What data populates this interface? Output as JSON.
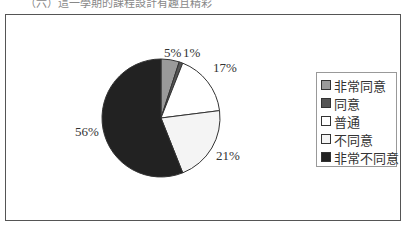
{
  "header": {
    "text": "（六）這一學期的課程設計有趣且精彩"
  },
  "chart_data": {
    "type": "pie",
    "title": "",
    "categories": [
      "非常同意",
      "同意",
      "普通",
      "不同意",
      "非常不同意"
    ],
    "values": [
      5,
      1,
      17,
      21,
      56
    ],
    "colors": [
      "#9a9a9a",
      "#555555",
      "#ffffff",
      "#f4f4f4",
      "#222222"
    ],
    "labels": [
      "5%",
      "1%",
      "17%",
      "21%",
      "56%"
    ],
    "legend_position": "right",
    "start_angle": "12 o'clock, clockwise"
  },
  "legend": {
    "items": [
      {
        "label": "非常同意",
        "color": "#9a9a9a"
      },
      {
        "label": "同意",
        "color": "#555555"
      },
      {
        "label": "普通",
        "color": "#ffffff"
      },
      {
        "label": "不同意",
        "color": "#f4f4f4"
      },
      {
        "label": "非常不同意",
        "color": "#222222"
      }
    ]
  }
}
